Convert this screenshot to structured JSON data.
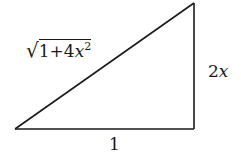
{
  "diagram": {
    "type": "right-triangle",
    "stroke_color": "#1a1a1a",
    "vertices": {
      "bottom_left": [
        15,
        129
      ],
      "bottom_right": [
        194,
        129
      ],
      "top_right": [
        194,
        3
      ]
    },
    "labels": {
      "hypotenuse": {
        "radical": "√",
        "radicand_prefix": "1+4",
        "variable": "x",
        "exponent": "2"
      },
      "vertical_side": {
        "coefficient": "2",
        "variable": "x"
      },
      "horizontal_side": "1"
    }
  }
}
